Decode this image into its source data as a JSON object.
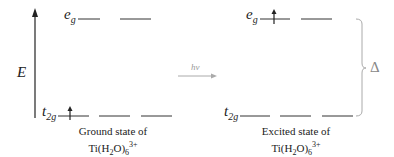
{
  "axis": {
    "label": "E"
  },
  "ground_state": {
    "eg_label": "e",
    "eg_sub": "g",
    "t2g_label": "t",
    "t2g_sub": "2g",
    "electron_in": "t2g",
    "caption_line1": "Ground state of",
    "caption_formula_main": "Ti(H",
    "caption_formula_sub1": "2",
    "caption_formula_mid": "O)",
    "caption_formula_sub2": "6",
    "caption_formula_sup": "3+"
  },
  "excited_state": {
    "eg_label": "e",
    "eg_sub": "g",
    "t2g_label": "t",
    "t2g_sub": "2g",
    "electron_in": "eg",
    "caption_line1": "Excited state of",
    "caption_formula_main": "Ti(H",
    "caption_formula_sub1": "2",
    "caption_formula_mid": "O)",
    "caption_formula_sub2": "6",
    "caption_formula_sup": "3+"
  },
  "transition": {
    "label": "hν"
  },
  "splitting": {
    "label": "Δ"
  },
  "colors": {
    "main": "#222222",
    "secondary": "#999999"
  }
}
